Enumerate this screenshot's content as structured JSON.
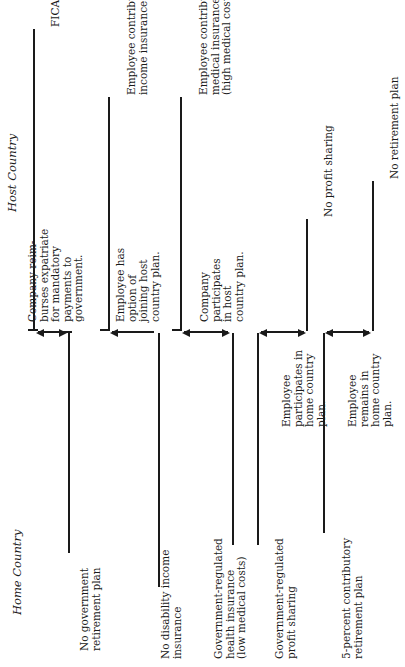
{
  "headers": {
    "home": "Home Country",
    "host": "Host Country"
  },
  "rows": [
    {
      "home": [
        "No government",
        "retirement plan"
      ],
      "action": [
        "Company reim-",
        "burses expatriate",
        "for mandatory",
        "payments to",
        "government."
      ],
      "host": [
        "FICA-type system"
      ],
      "arrow": "both"
    },
    {
      "home": [
        "No disability income",
        "insurance"
      ],
      "action": [
        "Employee has",
        "option of",
        "joining host",
        "country plan."
      ],
      "host": [
        "Employee contributory",
        "income insurance plan"
      ],
      "arrow": "to-home"
    },
    {
      "home": [
        "Government-regulated",
        "health insurance",
        "(low medical costs)"
      ],
      "action": [
        "Company",
        "participates",
        "in host",
        "country plan."
      ],
      "host": [
        "Employee contributory",
        "medical insurance",
        "(high medical costs)"
      ],
      "arrow": "both"
    },
    {
      "home": [
        "Government-regulated",
        "profit sharing"
      ],
      "action": [
        "Employee",
        "participates in",
        "home country",
        "plan."
      ],
      "host": [
        "No profit sharing"
      ],
      "arrow": "both"
    },
    {
      "home": [
        "5-percent contributory",
        "retirement plan"
      ],
      "action": [
        "Employee",
        "remains in",
        "home country",
        "plan."
      ],
      "host": [
        "No retirement plan"
      ],
      "arrow": "both"
    }
  ]
}
